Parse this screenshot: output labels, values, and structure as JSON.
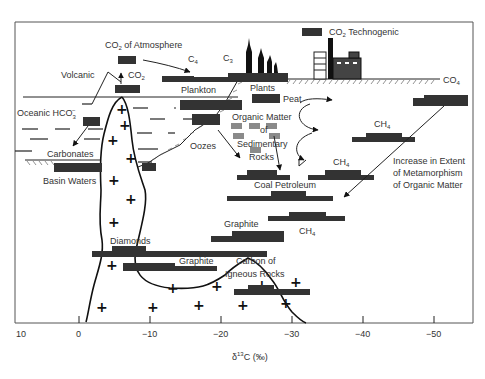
{
  "diagram": {
    "x_axis": {
      "label_prefix": "δ",
      "label_sup": "13",
      "label_suffix": "C (‰)",
      "ticks": [
        "10",
        "0",
        "−10",
        "−20",
        "−30",
        "−40",
        "−50"
      ]
    },
    "labels": {
      "co2_atmosphere_prefix": "CO",
      "co2_atmosphere_sub": "2",
      "co2_atmosphere_suffix": " of Atmosphere",
      "c4": "C",
      "c4_sub": "4",
      "c3": "C",
      "c3_sub": "3",
      "co2_volcanic": "CO",
      "co2_volcanic_sub": "2",
      "volcanic": "Volcanic",
      "oceanic_hco3": "Oceanic HCO",
      "oceanic_hco3_sub": "3",
      "oceanic_hco3_sup": "−",
      "carbonates": "Carbonates",
      "basin_waters": "Basin Waters",
      "plankton": "Plankton",
      "plants": "Plants",
      "peat": "Peat",
      "co2_techno_prefix": "CO",
      "co2_techno_sub": "2",
      "co2_techno_suffix": " Technogenic",
      "co4": "CO",
      "co4_sub": "4",
      "organic_matter_1": "Organic Matter",
      "organic_matter_2": "of",
      "organic_matter_3": "Sedimentary",
      "organic_matter_4": "Rocks",
      "oozes": "Oozes",
      "ch4_a": "CH",
      "ch4_a_sub": "4",
      "ch4_b": "CH",
      "ch4_b_sub": "4",
      "ch4_c": "CH",
      "ch4_c_sub": "4",
      "coal_petroleum": "Coal Petroleum",
      "metamorphism_1": "Increase in Extent",
      "metamorphism_2": "of Metamorphism",
      "metamorphism_3": "of Organic Matter",
      "graphite_a": "Graphite",
      "graphite_b": "Graphite",
      "diamonds": "Diamonds",
      "carbon_igneous_1": "Carbon of",
      "carbon_igneous_2": "Igneous Rocks"
    },
    "colors": {
      "bar": "#333333",
      "organic_bar": "#8a8a8a",
      "line": "#222222"
    }
  }
}
